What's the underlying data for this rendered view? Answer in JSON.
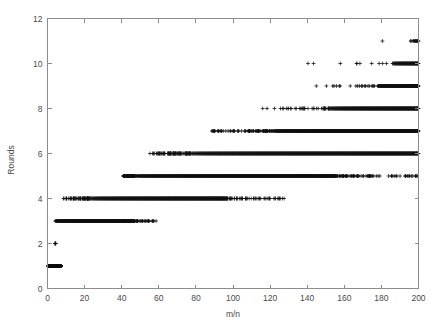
{
  "chart_data": {
    "type": "scatter",
    "title": "",
    "subtitle": "",
    "xlabel": "m/n",
    "ylabel": "Rounds",
    "xlim": [
      0,
      200
    ],
    "ylim": [
      0,
      12
    ],
    "xticks": [
      0,
      20,
      40,
      60,
      80,
      100,
      120,
      140,
      160,
      180,
      200
    ],
    "yticks": [
      0,
      2,
      4,
      6,
      8,
      10,
      12
    ],
    "xtick_labels": [
      "0",
      "20",
      "40",
      "60",
      "80",
      "100",
      "120",
      "140",
      "160",
      "180",
      "200"
    ],
    "ytick_labels": [
      "0",
      "2",
      "4",
      "6",
      "8",
      "10",
      "12"
    ],
    "grid": false,
    "legend": false,
    "legend_position": "none",
    "marker": "+",
    "marker_color": "#101010",
    "frame_color": "#8d8d8d",
    "background": "#ffffff",
    "series": [
      {
        "name": "Rounds",
        "bands": [
          {
            "y": 1,
            "x_start": 0.2,
            "x_end": 7.5,
            "dense_from": 0.2,
            "dense_to": 7.0,
            "sparse_tail_to": 7.8,
            "n_points": 150
          },
          {
            "y": 2,
            "x_start": 4.0,
            "x_end": 4.6,
            "dense_from": 4.0,
            "dense_to": 4.2,
            "sparse_tail_to": 4.6,
            "n_points": 2
          },
          {
            "y": 3,
            "x_start": 4.2,
            "x_end": 59.0,
            "dense_from": 4.2,
            "dense_to": 46.0,
            "sparse_tail_to": 59.0,
            "n_points": 420
          },
          {
            "y": 4,
            "x_start": 8.5,
            "x_end": 128.0,
            "dense_from": 23.0,
            "dense_to": 96.0,
            "sparse_tail_to": 128.0,
            "n_points": 620
          },
          {
            "y": 5,
            "x_start": 39.5,
            "x_end": 199.5,
            "dense_from": 47.0,
            "dense_to": 155.0,
            "sparse_tail_to": 199.5,
            "n_points": 780
          },
          {
            "y": 6,
            "x_start": 54.0,
            "x_end": 200.0,
            "dense_from": 77.0,
            "dense_to": 200.0,
            "sparse_tail_to": 200.0,
            "n_points": 900
          },
          {
            "y": 7,
            "x_start": 86.5,
            "x_end": 200.0,
            "dense_from": 122.0,
            "dense_to": 200.0,
            "sparse_tail_to": 200.0,
            "n_points": 760
          },
          {
            "y": 8,
            "x_start": 114.0,
            "x_end": 200.0,
            "dense_from": 152.0,
            "dense_to": 200.0,
            "sparse_tail_to": 200.0,
            "n_points": 420
          },
          {
            "y": 9,
            "x_start": 141.5,
            "x_end": 200.0,
            "dense_from": 178.0,
            "dense_to": 200.0,
            "sparse_tail_to": 200.0,
            "n_points": 210
          },
          {
            "y": 10,
            "x_start": 129.0,
            "x_end": 200.0,
            "dense_from": 186.0,
            "dense_to": 200.0,
            "sparse_tail_to": 200.0,
            "n_points": 95
          },
          {
            "y": 11,
            "x_start": 177.0,
            "x_end": 200.0,
            "dense_from": 197.0,
            "dense_to": 200.0,
            "sparse_tail_to": 200.0,
            "n_points": 14
          }
        ]
      }
    ]
  },
  "axes": {
    "y_axis_title": "Rounds",
    "x_axis_title": "m/n"
  }
}
